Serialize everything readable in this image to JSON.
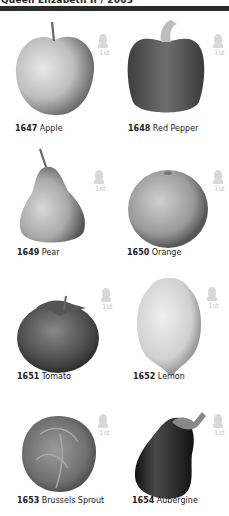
{
  "header": {
    "title": "Queen Elizabeth II / 2003"
  },
  "stamp_value": "1st",
  "stamps": [
    {
      "number": "1647",
      "name": "Apple",
      "shape": "apple-icon"
    },
    {
      "number": "1648",
      "name": "Red Pepper",
      "shape": "pepper-icon"
    },
    {
      "number": "1649",
      "name": "Pear",
      "shape": "pear-icon"
    },
    {
      "number": "1650",
      "name": "Orange",
      "shape": "orange-icon"
    },
    {
      "number": "1651",
      "name": "Tomato",
      "shape": "tomato-icon"
    },
    {
      "number": "1652",
      "name": "Lemon",
      "shape": "lemon-icon"
    },
    {
      "number": "1653",
      "name": "Brussels Sprout",
      "shape": "sprout-icon"
    },
    {
      "number": "1654",
      "name": "Aubergine",
      "shape": "aubergine-icon"
    }
  ]
}
